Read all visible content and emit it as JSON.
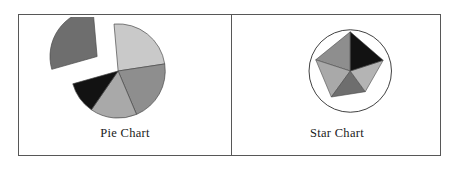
{
  "figure": {
    "border_color": "#575757",
    "background": "#ffffff",
    "panels": [
      {
        "id": "pie",
        "caption": "Pie Chart"
      },
      {
        "id": "star",
        "caption": "Star Chart"
      }
    ]
  },
  "chart_data": [
    {
      "type": "pie",
      "title": "Pie Chart",
      "xlabel": "",
      "ylabel": "",
      "legend": "none",
      "grid": false,
      "center": [
        99,
        55
      ],
      "radius": 48,
      "start_angle": 95,
      "direction": "clockwise",
      "categories": [
        "Slice 1",
        "Slice 2",
        "Slice 3",
        "Slice 4",
        "Slice 5"
      ],
      "values": [
        24,
        21,
        16,
        11,
        28
      ],
      "colors": [
        "#c9c9c9",
        "#8e8e8e",
        "#a9a9a9",
        "#121212",
        "#6e6e6e"
      ],
      "exploded": [
        false,
        false,
        false,
        false,
        true
      ],
      "explode_offset": 26,
      "edge_color": "#4a4a4a"
    },
    {
      "type": "radar",
      "title": "Star Chart",
      "xlabel": "",
      "ylabel": "",
      "legend": "none",
      "grid": false,
      "center": [
        119,
        55
      ],
      "outline_radius": 42,
      "outline_color": "#3d3d3d",
      "categories": [
        "Axis 1",
        "Axis 2",
        "Axis 3",
        "Axis 4",
        "Axis 5"
      ],
      "values": [
        0.95,
        0.88,
        0.78,
        0.62,
        0.84
      ],
      "rmax": 1.0,
      "start_angle": 90,
      "direction": "counterclockwise",
      "colors": [
        "#8e8e8e",
        "#a9a9a9",
        "#6e6e6e",
        "#b4b4b4",
        "#121212"
      ],
      "edge_color": "#4a4a4a"
    }
  ]
}
